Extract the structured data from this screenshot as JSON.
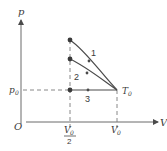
{
  "diagram": {
    "type": "pV-diagram",
    "axes": {
      "y_label": "p",
      "x_label": "V",
      "origin_label": "O"
    },
    "ticks": {
      "p0_label": "p",
      "p0_sub": "0",
      "v_half_num": "V",
      "v_half_sub": "0",
      "v_half_den": "2",
      "v0_label": "V",
      "v0_sub": "0"
    },
    "state_label": "T",
    "state_sub": "0",
    "processes": [
      {
        "id": "1",
        "label": "1",
        "from": "T0 at V0,p0",
        "to": "V0/2, highest p",
        "kind": "adiabatic curve"
      },
      {
        "id": "2",
        "label": "2",
        "from": "T0 at V0,p0",
        "to": "V0/2, intermediate p",
        "kind": "isothermal curve"
      },
      {
        "id": "3",
        "label": "3",
        "from": "T0 at V0,p0",
        "to": "V0/2, p0",
        "kind": "isobaric line"
      }
    ],
    "colors": {
      "line": "#4a4a4a",
      "dashed": "#7a7a7a"
    }
  }
}
